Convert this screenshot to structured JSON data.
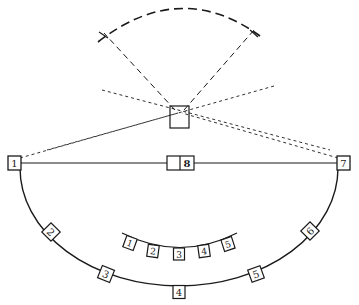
{
  "diagram": {
    "type": "stage-layout",
    "colors": {
      "line": "#1a1a1a",
      "background": "#ffffff"
    },
    "camera": {
      "label": ""
    },
    "center_box": {
      "label": "8"
    },
    "end_boxes": [
      {
        "label": "1"
      },
      {
        "label": "7"
      }
    ],
    "outer_arc_boxes": [
      {
        "label": "2"
      },
      {
        "label": "3"
      },
      {
        "label": "4"
      },
      {
        "label": "5"
      },
      {
        "label": "6"
      }
    ],
    "inner_arc_boxes": [
      {
        "label": "1"
      },
      {
        "label": "2"
      },
      {
        "label": "3"
      },
      {
        "label": "4"
      },
      {
        "label": "5"
      }
    ]
  }
}
